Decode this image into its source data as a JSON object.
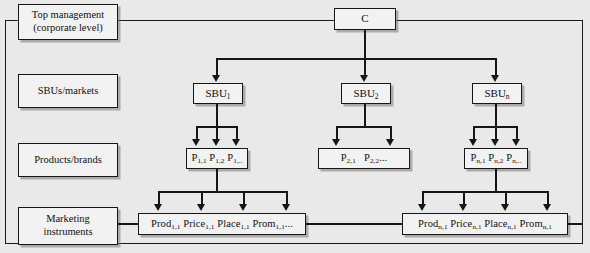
{
  "diagram": {
    "background_color": "#e9e9e9",
    "box_fill": "#f2f2f2",
    "line_color": "#161616",
    "levels": [
      {
        "id": "level-top",
        "label_line1": "Top management",
        "label_line2": "(corporate level)"
      },
      {
        "id": "level-sbu",
        "label_line1": "SBUs/markets",
        "label_line2": ""
      },
      {
        "id": "level-products",
        "label_line1": "Products/brands",
        "label_line2": ""
      },
      {
        "id": "level-marketing",
        "label_line1": "Marketing",
        "label_line2": "instruments"
      }
    ],
    "corporate": {
      "label": "C"
    },
    "sbus": [
      {
        "base": "SBU",
        "sub": "1"
      },
      {
        "base": "SBU",
        "sub": "2"
      },
      {
        "base": "SBU",
        "sub": "n"
      }
    ],
    "product_boxes": [
      {
        "id": "products-sbu1",
        "items": [
          {
            "base": "P",
            "sub": "1,1"
          },
          {
            "base": "P",
            "sub": "1,2"
          },
          {
            "base": "P",
            "sub": "1,.."
          }
        ]
      },
      {
        "id": "products-sbu2",
        "items": [
          {
            "base": "P",
            "sub": "2,1"
          },
          {
            "base": "P",
            "sub": "2,2",
            "trail": "..."
          }
        ]
      },
      {
        "id": "products-sbun",
        "items": [
          {
            "base": "P",
            "sub": "n,1"
          },
          {
            "base": "P",
            "sub": "n,2"
          },
          {
            "base": "P",
            "sub": "n,.."
          }
        ]
      }
    ],
    "marketing_boxes": [
      {
        "id": "marketing-p11",
        "items": [
          {
            "base": "Prod",
            "sub": "1,1"
          },
          {
            "base": "Price",
            "sub": "1,1"
          },
          {
            "base": "Place",
            "sub": "1,1"
          },
          {
            "base": "Prom",
            "sub": "1,1",
            "trail": "..."
          }
        ]
      },
      {
        "id": "marketing-pn1",
        "items": [
          {
            "base": "Prod",
            "sub": "n,1"
          },
          {
            "base": "Price",
            "sub": "n,1"
          },
          {
            "base": "Place",
            "sub": "n,1"
          },
          {
            "base": "Prom",
            "sub": "n,1"
          }
        ]
      }
    ]
  }
}
